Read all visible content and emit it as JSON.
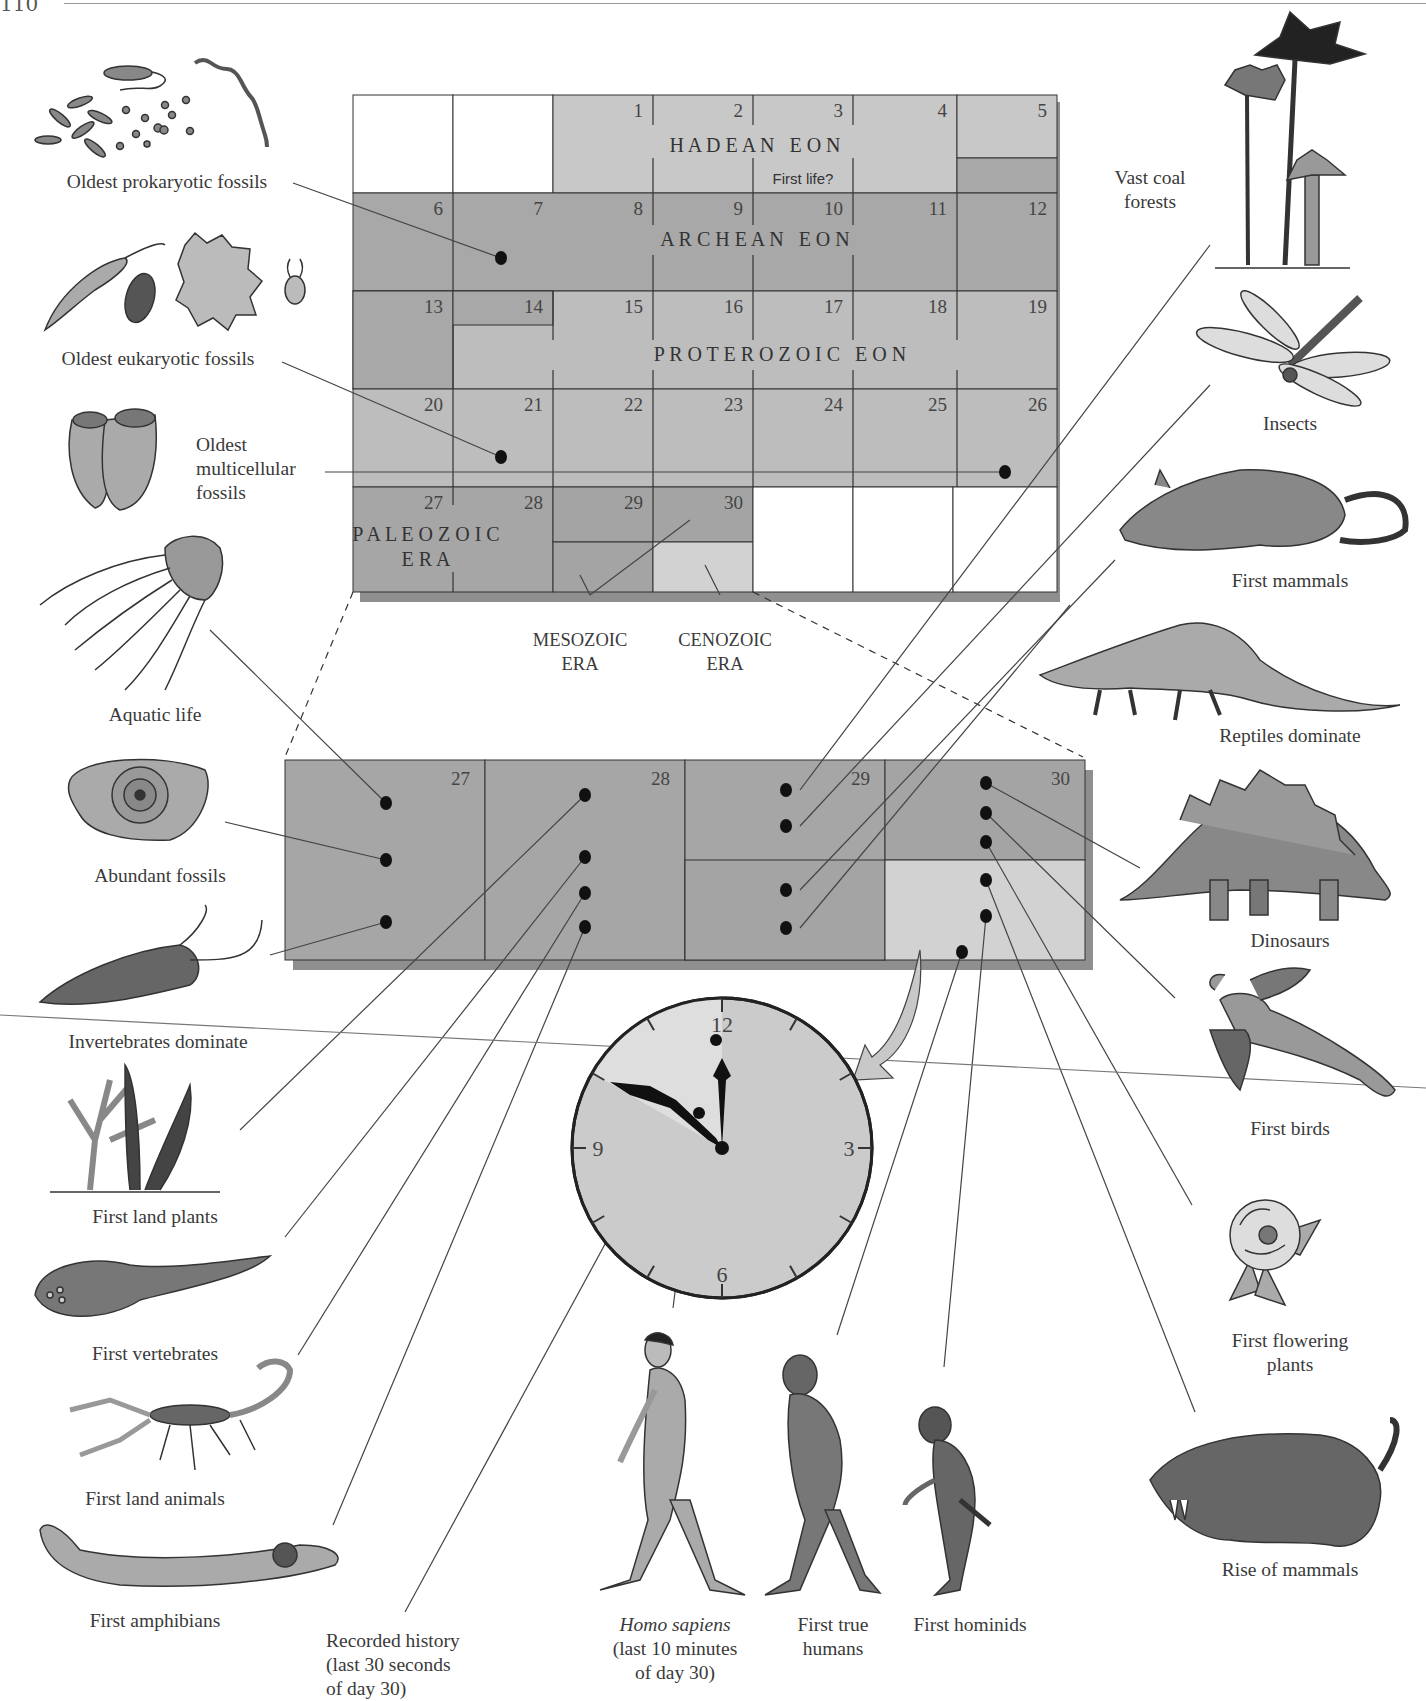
{
  "page": {
    "page_number": "110"
  },
  "calendar": {
    "days": [
      "1",
      "2",
      "3",
      "4",
      "5",
      "6",
      "7",
      "8",
      "9",
      "10",
      "11",
      "12",
      "13",
      "14",
      "15",
      "16",
      "17",
      "18",
      "19",
      "20",
      "21",
      "22",
      "23",
      "24",
      "25",
      "26",
      "27",
      "28",
      "29",
      "30"
    ],
    "eons": {
      "hadean": "H A D E A N   E O N",
      "archean": "A R C H E A N   E O N",
      "proterozoic": "P R O T E R O Z O I C   E O N",
      "paleozoic_line1": "P A L E O Z O I C",
      "paleozoic_line2": "E R A"
    },
    "first_life_note": "First life?",
    "mesozoic_label": [
      "MESOZOIC",
      "ERA"
    ],
    "cenozoic_label": [
      "CENOZOIC",
      "ERA"
    ],
    "colors": {
      "hadean": "#c8c8c8",
      "archean": "#a8a8a8",
      "proterozoic": "#bdbdbd",
      "paleozoic": "#a6a6a6",
      "mesozoic": "#a4a4a4",
      "cenozoic": "#d2d2d2",
      "shadow": "#8f8f8f",
      "empty": "#ffffff"
    }
  },
  "detail": {
    "days": [
      "27",
      "28",
      "29",
      "30"
    ]
  },
  "clock": {
    "numerals": [
      "12",
      "3",
      "6",
      "9"
    ],
    "time_shown": "11:50"
  },
  "labels": {
    "left": [
      {
        "id": "prokaryotic",
        "text": "Oldest prokaryotic fossils",
        "icon": "bacteria-icon"
      },
      {
        "id": "eukaryotic",
        "text": "Oldest eukaryotic fossils",
        "icon": "protist-icon"
      },
      {
        "id": "multicellular",
        "lines": [
          "Oldest",
          "multicellular",
          "fossils"
        ],
        "icon": "multicellular-fossil-icon"
      },
      {
        "id": "aquatic",
        "text": "Aquatic life",
        "icon": "jellyfish-icon"
      },
      {
        "id": "abundant",
        "text": "Abundant fossils",
        "icon": "ammonite-fossil-icon"
      },
      {
        "id": "invertebrates",
        "text": "Invertebrates dominate",
        "icon": "trilobite-icon"
      },
      {
        "id": "land-plants",
        "text": "First land plants",
        "icon": "land-plant-icon"
      },
      {
        "id": "vertebrates",
        "text": "First vertebrates",
        "icon": "jawless-fish-icon"
      },
      {
        "id": "land-animals",
        "text": "First land animals",
        "icon": "scorpion-icon"
      },
      {
        "id": "amphibians",
        "text": "First amphibians",
        "icon": "amphibian-icon"
      }
    ],
    "right": [
      {
        "id": "coal",
        "lines": [
          "Vast coal",
          "forests"
        ],
        "icon": "coal-forest-icon"
      },
      {
        "id": "insects",
        "text": "Insects",
        "icon": "dragonfly-icon"
      },
      {
        "id": "mammals",
        "text": "First mammals",
        "icon": "early-mammal-icon"
      },
      {
        "id": "reptiles",
        "text": "Reptiles dominate",
        "icon": "reptile-icon"
      },
      {
        "id": "dinosaurs",
        "text": "Dinosaurs",
        "icon": "stegosaurus-icon"
      },
      {
        "id": "birds",
        "text": "First birds",
        "icon": "archaeopteryx-icon"
      },
      {
        "id": "flowering",
        "lines": [
          "First flowering",
          "plants"
        ],
        "icon": "flower-icon"
      },
      {
        "id": "rise-mammals",
        "text": "Rise of mammals",
        "icon": "sabertooth-icon"
      }
    ],
    "bottom": [
      {
        "id": "recorded-history",
        "lines": [
          "Recorded history",
          "(last 30 seconds",
          "of day 30)"
        ]
      },
      {
        "id": "homo-sapiens",
        "italic": "Homo sapiens",
        "lines": [
          "(last 10 minutes",
          "of day 30)"
        ],
        "icon": "homo-sapiens-icon"
      },
      {
        "id": "true-humans",
        "lines": [
          "First true",
          "humans"
        ],
        "icon": "homo-erectus-icon"
      },
      {
        "id": "hominids",
        "text": "First hominids",
        "icon": "hominid-icon"
      }
    ]
  }
}
